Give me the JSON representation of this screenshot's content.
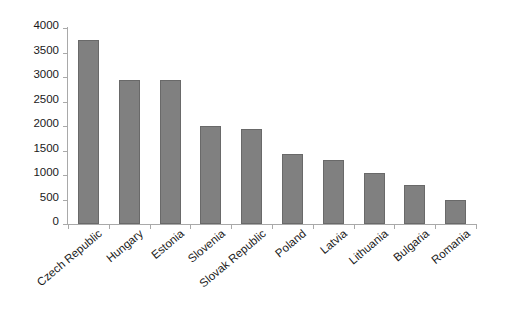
{
  "chart_data": {
    "type": "bar",
    "title": "",
    "subtitle": "",
    "xlabel": "",
    "ylabel": "",
    "categories": [
      "Czech Republic",
      "Hungary",
      "Estonia",
      "Slovenia",
      "Slovak Republic",
      "Poland",
      "Latvia",
      "Lithuania",
      "Bulgaria",
      "Romania"
    ],
    "values": [
      3755,
      2935,
      2930,
      2000,
      1930,
      1420,
      1310,
      1050,
      790,
      490
    ],
    "ylim": [
      0,
      4000
    ],
    "yticks": [
      0,
      500,
      1000,
      1500,
      2000,
      2500,
      3000,
      3500,
      4000
    ],
    "ytick_labels": [
      "0",
      "500",
      "1000",
      "1500",
      "2000",
      "2500",
      "3000",
      "3500",
      "4000"
    ],
    "grid": false,
    "legend": null,
    "legend_position": "none",
    "bar_color": "#808080",
    "bar_border_color": "#696969",
    "axis_color": "#a9a9a9",
    "background_color": "#ffffff",
    "text_color": "#1a1a1a",
    "xlabel_rotation_deg": -40
  }
}
